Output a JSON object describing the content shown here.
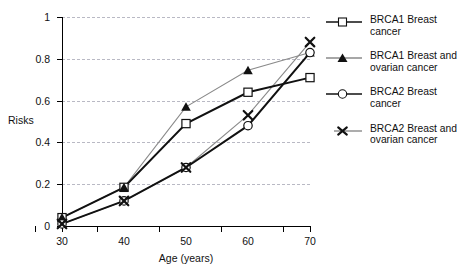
{
  "chart_data": {
    "type": "line",
    "title": "",
    "xlabel": "Age (years)",
    "ylabel": "Risks",
    "x": [
      30,
      40,
      50,
      60,
      70
    ],
    "xtick_labels": [
      "30",
      "40",
      "50",
      "60",
      "70"
    ],
    "ytick_labels": [
      "0",
      "0.2",
      "0.4",
      "0.6",
      "0.8",
      "1"
    ],
    "ytick_values": [
      0,
      0.2,
      0.4,
      0.6,
      0.8,
      1
    ],
    "xlim": [
      30,
      70
    ],
    "ylim": [
      0,
      1
    ],
    "grid": "horizontal-dashed",
    "legend_position": "right",
    "series": [
      {
        "name": "BRCA1 Breast cancer",
        "marker": "open-square",
        "line": "thick-black",
        "values": [
          0.04,
          0.185,
          0.49,
          0.64,
          0.71
        ]
      },
      {
        "name": "BRCA1 Breast and ovarian cancer",
        "marker": "filled-triangle",
        "line": "thin-gray",
        "values": [
          0.04,
          0.185,
          0.57,
          0.745,
          0.83
        ]
      },
      {
        "name": "BRCA2 Breast cancer",
        "marker": "open-circle",
        "line": "thick-black",
        "values": [
          0.01,
          0.12,
          0.28,
          0.48,
          0.83
        ]
      },
      {
        "name": "BRCA2 Breast and ovarian cancer",
        "marker": "x-cross",
        "line": "thin-gray",
        "values": [
          0.01,
          0.12,
          0.28,
          0.53,
          0.88
        ]
      }
    ]
  },
  "legend": {
    "items": [
      {
        "label": "BRCA1 Breast cancer"
      },
      {
        "label": "BRCA1 Breast and\novarian cancer"
      },
      {
        "label": "BRCA2 Breast cancer"
      },
      {
        "label": "BRCA2 Breast and\novarian cancer"
      }
    ]
  },
  "axes": {
    "x_title": "Age (years)",
    "y_title": "Risks"
  },
  "colors": {
    "axis": "#000000",
    "grid": "#b9b9c4",
    "line_primary": "#111111",
    "line_secondary": "#8a8a8a",
    "marker_fill": "#ffffff",
    "text": "#111111"
  }
}
